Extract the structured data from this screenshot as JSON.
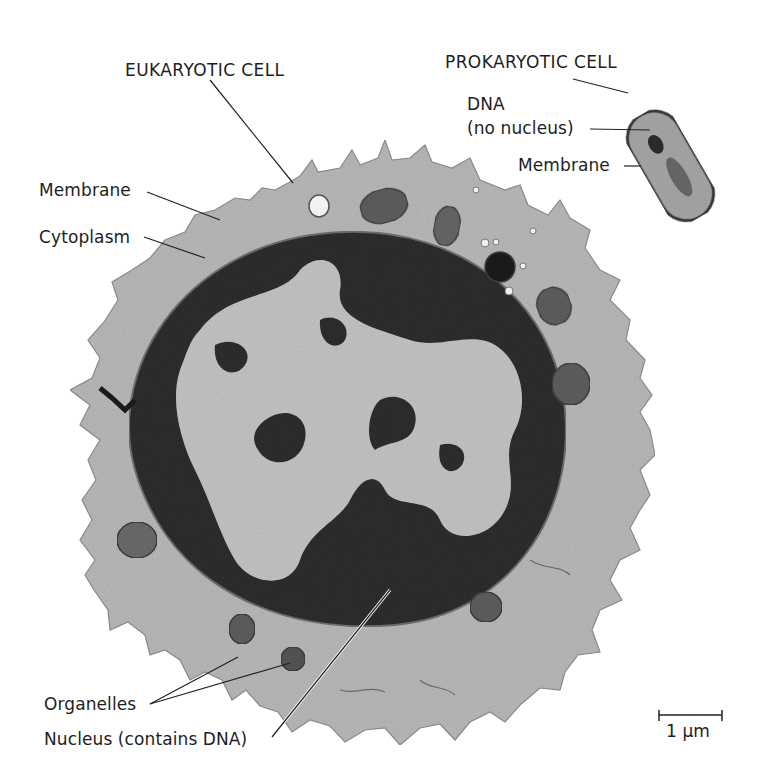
{
  "figure": {
    "type": "electron micrograph comparison",
    "colors": {
      "background": "#ffffff",
      "cytoplasm": "#b9b9b9",
      "cytoplasm_edge": "#8f8f8f",
      "heterochromatin": "#2e2e2e",
      "euchromatin": "#c4c4c4",
      "organelle": "#5e5e5e",
      "organelle_dark": "#1a1a1a",
      "vesicle": "#f2f2f2",
      "bacterium_fill": "#a7a7a7",
      "bacterium_edge": "#3a3a3a",
      "leader_line": "#222222"
    }
  },
  "labels": {
    "eukaryotic_cell": "EUKARYOTIC CELL",
    "membrane_left": "Membrane",
    "cytoplasm": "Cytoplasm",
    "organelles": "Organelles",
    "nucleus": "Nucleus (contains DNA)",
    "prokaryotic_cell": "PROKARYOTIC CELL",
    "dna": "DNA",
    "no_nucleus": "(no nucleus)",
    "membrane_right": "Membrane"
  },
  "scale_bar": {
    "label": "1 µm"
  }
}
